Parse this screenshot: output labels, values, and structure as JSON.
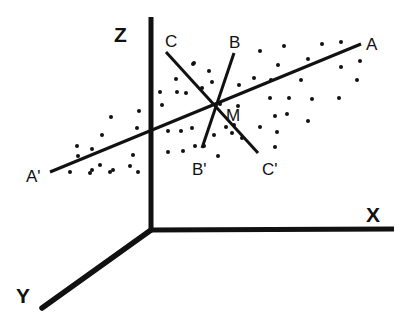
{
  "diagram": {
    "title": "",
    "axes": {
      "origin": [
        151,
        230
      ],
      "z": {
        "label": "Z",
        "end": [
          151,
          17
        ],
        "label_pos": [
          114,
          42
        ]
      },
      "x": {
        "label": "X",
        "end": [
          394,
          229
        ],
        "label_pos": [
          366,
          222
        ]
      },
      "y": {
        "label": "Y",
        "end": [
          42,
          308
        ],
        "label_pos": [
          16,
          303
        ]
      }
    },
    "lines": [
      {
        "name": "AA'",
        "from": [
          50,
          172
        ],
        "to": [
          361,
          44
        ],
        "label_start": "A'",
        "label_end": "A",
        "label_start_pos": [
          26,
          182
        ],
        "label_end_pos": [
          366,
          50
        ]
      },
      {
        "name": "BB'",
        "from": [
          202,
          148
        ],
        "to": [
          234,
          53
        ],
        "label_start": "B'",
        "label_end": "B",
        "label_start_pos": [
          192,
          175
        ],
        "label_end_pos": [
          229,
          48
        ]
      },
      {
        "name": "CC'",
        "from": [
          166,
          52
        ],
        "to": [
          258,
          153
        ],
        "label_start": "C",
        "label_end": "C'",
        "label_start_pos": [
          165,
          47
        ],
        "label_end_pos": [
          262,
          175
        ]
      }
    ],
    "center": {
      "label": "M",
      "pos": [
        213,
        103
      ],
      "label_pos": [
        226,
        121
      ]
    },
    "colors": {
      "ink": "#111111",
      "background": "#ffffff"
    },
    "dots": [
      [
        194,
        63
      ],
      [
        176,
        79
      ],
      [
        209,
        71
      ],
      [
        177,
        92
      ],
      [
        186,
        93
      ],
      [
        202,
        88
      ],
      [
        193,
        64
      ],
      [
        160,
        92
      ],
      [
        162,
        105
      ],
      [
        139,
        111
      ],
      [
        111,
        117
      ],
      [
        102,
        135
      ],
      [
        77,
        146
      ],
      [
        92,
        149
      ],
      [
        137,
        128
      ],
      [
        78,
        156
      ],
      [
        92,
        170
      ],
      [
        100,
        165
      ],
      [
        113,
        170
      ],
      [
        133,
        155
      ],
      [
        138,
        172
      ],
      [
        70,
        172
      ],
      [
        90,
        173
      ],
      [
        110,
        172
      ],
      [
        130,
        166
      ],
      [
        168,
        131
      ],
      [
        181,
        131
      ],
      [
        192,
        128
      ],
      [
        195,
        146
      ],
      [
        204,
        146
      ],
      [
        214,
        135
      ],
      [
        226,
        127
      ],
      [
        168,
        152
      ],
      [
        183,
        151
      ],
      [
        218,
        156
      ],
      [
        232,
        133
      ],
      [
        242,
        138
      ],
      [
        234,
        125
      ],
      [
        260,
        51
      ],
      [
        284,
        46
      ],
      [
        322,
        44
      ],
      [
        341,
        42
      ],
      [
        360,
        61
      ],
      [
        341,
        67
      ],
      [
        308,
        59
      ],
      [
        278,
        65
      ],
      [
        254,
        78
      ],
      [
        271,
        80
      ],
      [
        301,
        80
      ],
      [
        357,
        80
      ],
      [
        339,
        98
      ],
      [
        312,
        99
      ],
      [
        289,
        98
      ],
      [
        270,
        98
      ],
      [
        238,
        106
      ],
      [
        275,
        116
      ],
      [
        287,
        114
      ],
      [
        308,
        121
      ],
      [
        260,
        127
      ],
      [
        277,
        132
      ],
      [
        275,
        147
      ],
      [
        220,
        104
      ],
      [
        212,
        82
      ],
      [
        239,
        85
      ]
    ]
  }
}
